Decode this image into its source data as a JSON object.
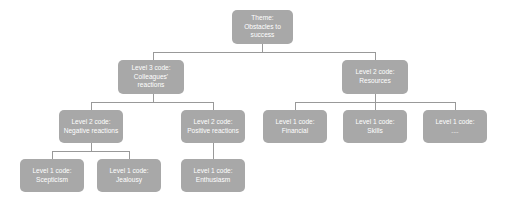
{
  "diagram": {
    "title_visible": false,
    "style": {
      "node_fill": "#a8a8a8",
      "node_text_color": "#ffffff",
      "edge_color": "#999999",
      "background": "#ffffff"
    },
    "nodes": {
      "theme": {
        "id": "theme",
        "level_label": "Theme:",
        "name_line1": "Obstacles to",
        "name_line2": "success"
      },
      "colleagues": {
        "id": "colleagues",
        "level_label": "Level 3 code:",
        "name_line1": "Colleagues'",
        "name_line2": "reactions"
      },
      "resources": {
        "id": "resources",
        "level_label": "Level 2 code:",
        "name_line1": "Resources"
      },
      "negative": {
        "id": "negative",
        "level_label": "Level  2 code:",
        "name_line1": "Negative reactions"
      },
      "positive": {
        "id": "positive",
        "level_label": "Level  2 code:",
        "name_line1": "Positive reactions"
      },
      "scepticism": {
        "id": "scepticism",
        "level_label": "Level 1 code:",
        "name_line1": "Scepticism"
      },
      "jealousy": {
        "id": "jealousy",
        "level_label": "Level 1 code:",
        "name_line1": "Jealousy"
      },
      "enthusiasm": {
        "id": "enthusiasm",
        "level_label": "Level 1 code:",
        "name_line1": "Enthusiasm"
      },
      "financial": {
        "id": "financial",
        "level_label": "Level 1 code:",
        "name_line1": "Financial"
      },
      "skills": {
        "id": "skills",
        "level_label": "Level 1 code:",
        "name_line1": "Skills"
      },
      "other_resource": {
        "id": "other_resource",
        "level_label": "Level 1 code:",
        "name_line1": "...."
      }
    },
    "edges": [
      {
        "from": "theme",
        "to": "colleagues"
      },
      {
        "from": "theme",
        "to": "resources"
      },
      {
        "from": "colleagues",
        "to": "negative"
      },
      {
        "from": "colleagues",
        "to": "positive"
      },
      {
        "from": "negative",
        "to": "scepticism"
      },
      {
        "from": "negative",
        "to": "jealousy"
      },
      {
        "from": "positive",
        "to": "enthusiasm"
      },
      {
        "from": "resources",
        "to": "financial"
      },
      {
        "from": "resources",
        "to": "skills"
      },
      {
        "from": "resources",
        "to": "other_resource"
      }
    ]
  }
}
